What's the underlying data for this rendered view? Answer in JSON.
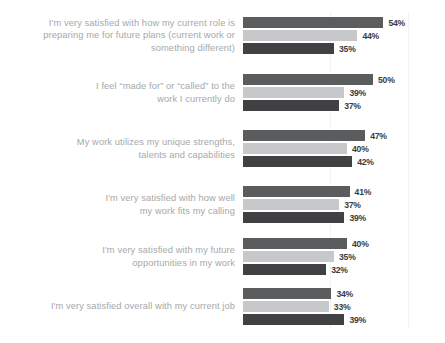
{
  "chart_data": {
    "type": "bar",
    "orientation": "horizontal",
    "grouped": true,
    "title": "",
    "subtitle": "",
    "xlabel": "",
    "ylabel": "",
    "xlim": [
      0,
      60
    ],
    "grid": "faint-vertical",
    "legend": "none",
    "value_suffix": "%",
    "colors": {
      "series_1": "#5b5c5e",
      "series_2": "#c7c8ca",
      "series_3": "#414042",
      "label_text": "#a6a8ab",
      "value_text": "#3b3b3b",
      "background": "#ffffff",
      "gridline": "#f2f2f2"
    },
    "categories": [
      "I'm very satisfied with how my current role is\npreparing me for future plans (current work or\nsomething different)",
      "I feel “made for” or “called” to the\nwork I currently do",
      "My work utilizes my unique strengths,\ntalents and capabilities",
      "I'm very satisfied with how well\nmy work fits my calling",
      "I'm very satisfied with my future\nopportunities in my work",
      "I'm very satisfied overall with my current job"
    ],
    "series": [
      {
        "name": "series_1",
        "values": [
          54,
          50,
          47,
          41,
          40,
          34
        ]
      },
      {
        "name": "series_2",
        "values": [
          44,
          39,
          40,
          37,
          35,
          33
        ]
      },
      {
        "name": "series_3",
        "values": [
          35,
          37,
          42,
          39,
          32,
          39
        ]
      }
    ],
    "value_labels": [
      [
        "54%",
        "44%",
        "35%"
      ],
      [
        "50%",
        "39%",
        "37%"
      ],
      [
        "47%",
        "40%",
        "42%"
      ],
      [
        "41%",
        "37%",
        "39%"
      ],
      [
        "40%",
        "35%",
        "32%"
      ],
      [
        "34%",
        "33%",
        "39%"
      ]
    ]
  }
}
